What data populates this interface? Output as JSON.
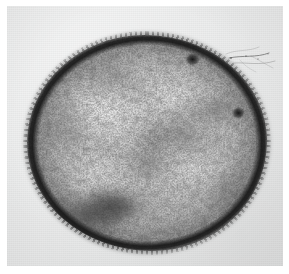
{
  "image": {
    "kind": "transmission-electron-micrograph",
    "subject": "single rounded bacterial cell (thin-section TEM)",
    "width_px": 289,
    "height_px": 274,
    "background_color": "#ffffff",
    "plate_color": "#e9eaea",
    "caption": "",
    "title": "",
    "scale_bar_label": "",
    "magnification_label": "",
    "annotations": []
  },
  "plate": {
    "x": 7,
    "y": 6,
    "width": 276,
    "height": 260,
    "tone": "light warm grey film background",
    "grain": "fine scan grain"
  },
  "cell": {
    "shape": "near-circular / slightly polygonal coccoid profile",
    "bounds": {
      "left": 27,
      "top": 35,
      "right": 267,
      "bottom": 250
    },
    "center": {
      "x": 147,
      "y": 142
    },
    "diameter_px": {
      "horizontal": 240,
      "vertical": 216
    },
    "wall_color": "#141414",
    "wall_thickness_px": 5,
    "wall_texture": "dark, fuzzy, finely spiculate rim",
    "cytoplasm_color": "#c2c2c2",
    "cytoplasm_texture": "mottled, granular; dense ribosome speckle over lighter nucleoid lobes",
    "nucleoid_color": "#e4e4e4"
  },
  "features": [
    {
      "name": "dark-granule-top-right",
      "x": 192,
      "y": 61,
      "r": 6,
      "note": "star-shaped dense body near upper-right wall"
    },
    {
      "name": "dark-granule-right-edge",
      "x": 240,
      "y": 114,
      "r": 5,
      "note": "round dense body at right margin"
    },
    {
      "name": "dense-patch-lower-left",
      "x": 104,
      "y": 208,
      "r": 22,
      "note": "large diffuse electron-dense patch"
    },
    {
      "name": "dense-patch-center",
      "x": 152,
      "y": 140,
      "r": 16,
      "note": "central diffuse dense region"
    },
    {
      "name": "filament-artifact-upper-right",
      "x": 255,
      "y": 62,
      "note": "thin wispy filament / debris trailing off the cell to upper right"
    }
  ],
  "colors": {
    "page_background": "#ffffff",
    "film_background": "#e9eaea",
    "cell_wall": "#141414",
    "cytoplasm_mid": "#c2c2c2",
    "cytoplasm_light": "#e4e4e4",
    "granule_dark": "#1b1b1b"
  }
}
